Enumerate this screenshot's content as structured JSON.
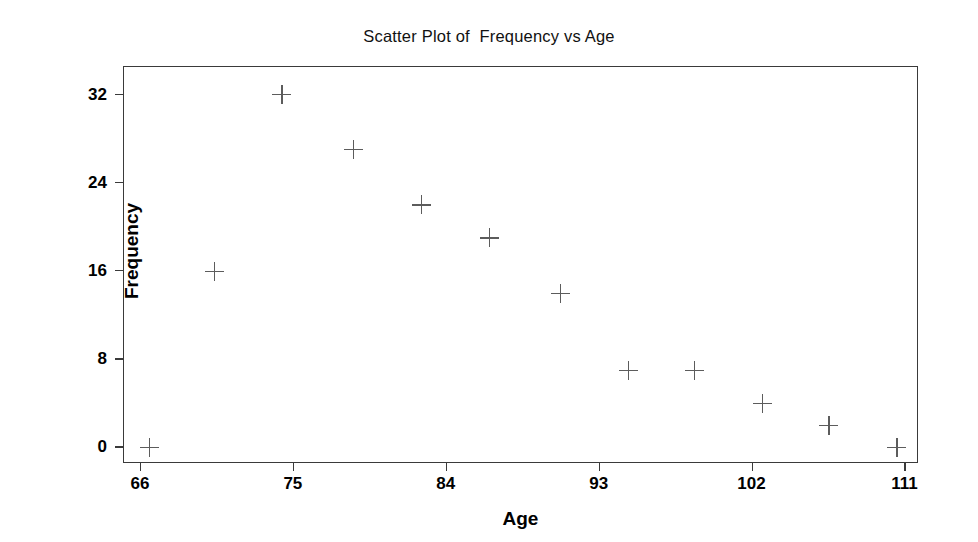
{
  "chart_data": {
    "type": "scatter",
    "title": "Scatter Plot of  Frequency vs Age",
    "xlabel": "Age",
    "ylabel": "Frequency",
    "xlim": [
      65.0,
      111.8
    ],
    "ylim": [
      -1.5,
      34.5
    ],
    "grid": false,
    "legend": null,
    "marker": "plus",
    "marker_color": "#5c5c5c",
    "frame_color": "#3a3a3a",
    "background": "#ffffff",
    "xticks": [
      66,
      75,
      84,
      93,
      102,
      111
    ],
    "yticks": [
      0,
      8,
      16,
      24,
      32
    ],
    "x": [
      66.5,
      70.3,
      74.3,
      78.5,
      82.5,
      86.5,
      90.7,
      94.7,
      98.6,
      102.6,
      106.5,
      110.5
    ],
    "y": [
      0,
      16,
      32,
      27,
      22,
      19,
      14,
      7,
      7,
      4,
      2,
      0
    ],
    "points": [
      {
        "x": 66.5,
        "y": 0
      },
      {
        "x": 70.3,
        "y": 16
      },
      {
        "x": 74.3,
        "y": 32
      },
      {
        "x": 78.5,
        "y": 27
      },
      {
        "x": 82.5,
        "y": 22
      },
      {
        "x": 86.5,
        "y": 19
      },
      {
        "x": 90.7,
        "y": 14
      },
      {
        "x": 94.7,
        "y": 7
      },
      {
        "x": 98.6,
        "y": 7
      },
      {
        "x": 102.6,
        "y": 4
      },
      {
        "x": 106.5,
        "y": 2
      },
      {
        "x": 110.5,
        "y": 0
      }
    ]
  }
}
